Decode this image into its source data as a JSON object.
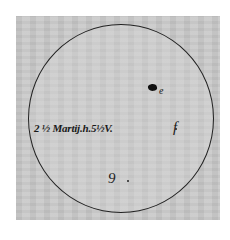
{
  "figure": {
    "type": "sunspot-drawing",
    "date_label": "2 ½ Martij.h.5½V.",
    "spots": [
      {
        "label": "e",
        "appearance": "large dark spot"
      },
      {
        "label": "f",
        "appearance": "small spot"
      },
      {
        "label": "g",
        "appearance": "small spot"
      }
    ],
    "letters": {
      "e": "e",
      "f": "f",
      "g": "9"
    }
  }
}
